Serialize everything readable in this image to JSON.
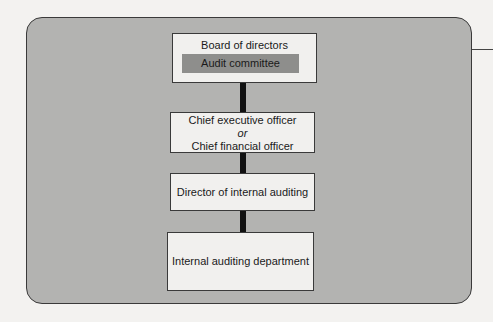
{
  "diagram": {
    "type": "org-chart",
    "nodes": [
      {
        "id": "board",
        "label": "Board of directors",
        "sub": "Audit committee"
      },
      {
        "id": "ceo_cfo",
        "line1": "Chief executive officer",
        "line2": "or",
        "line3": "Chief financial officer"
      },
      {
        "id": "director",
        "label": "Director of internal auditing"
      },
      {
        "id": "department",
        "label": "Internal auditing department"
      }
    ],
    "edges": [
      [
        "board",
        "ceo_cfo"
      ],
      [
        "ceo_cfo",
        "director"
      ],
      [
        "director",
        "department"
      ]
    ],
    "colors": {
      "panel": "#b3b3b1",
      "box": "#f1f0ee",
      "audit": "#8e8e8c",
      "connector": "#111111"
    }
  }
}
